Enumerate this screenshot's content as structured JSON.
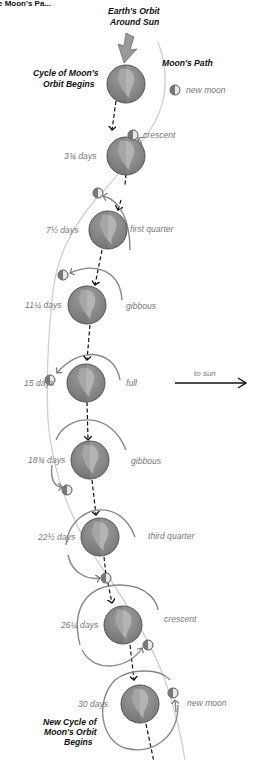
{
  "title_fragment": "e Moon's Pa...",
  "header": {
    "earth_orbit_line1": "Earth's Orbit",
    "earth_orbit_line2": "Around Sun",
    "cycle_begins_line1": "Cycle of Moon's",
    "cycle_begins_line2": "Orbit Begins",
    "moons_path": "Moon's Path"
  },
  "to_sun": "to sun",
  "footer": {
    "line1": "New Cycle of",
    "line2": "Moon's Orbit",
    "line3": "Begins"
  },
  "colors": {
    "earth_fill": "#8a8a8a",
    "earth_land": "#b5b5b5",
    "earth_stroke": "#555555",
    "orbit_arc": "#777777",
    "moon_path": "#c8c8c8",
    "arrow_black": "#111111",
    "big_arrow": "#9a9a9a"
  },
  "stages": [
    {
      "days": "",
      "phase": "new moon",
      "earth": [
        126,
        84
      ],
      "moon": [
        175,
        90
      ],
      "phase_label_pos": [
        186,
        93
      ]
    },
    {
      "days": "3¾ days",
      "phase": "crescent",
      "earth": [
        126,
        156
      ],
      "moon": [
        133,
        135
      ],
      "phase_label_pos": [
        143,
        138
      ]
    },
    {
      "days": "7½ days",
      "phase": "first quarter",
      "earth": [
        108,
        230
      ],
      "moon": [
        98,
        193
      ],
      "phase_label_pos": [
        130,
        232
      ]
    },
    {
      "days": "11¼ days",
      "phase": "gibbous",
      "earth": [
        87,
        305
      ],
      "moon": [
        63,
        275
      ],
      "phase_label_pos": [
        126,
        309
      ]
    },
    {
      "days": "15 days",
      "phase": "full",
      "earth": [
        86,
        383
      ],
      "moon": [
        50,
        380
      ],
      "phase_label_pos": [
        126,
        386
      ]
    },
    {
      "days": "18¾ days",
      "phase": "gibbous",
      "earth": [
        90,
        460
      ],
      "moon": [
        67,
        490
      ],
      "phase_label_pos": [
        131,
        464
      ]
    },
    {
      "days": "22½ days",
      "phase": "third quarter",
      "earth": [
        100,
        537
      ],
      "moon": [
        106,
        578
      ],
      "phase_label_pos": [
        148,
        539
      ]
    },
    {
      "days": "26¼ days",
      "phase": "crescent",
      "earth": [
        123,
        625
      ],
      "moon": [
        148,
        645
      ],
      "phase_label_pos": [
        164,
        622
      ]
    },
    {
      "days": "30 days",
      "phase": "new moon",
      "earth": [
        140,
        704
      ],
      "moon": [
        173,
        693
      ],
      "phase_label_pos": [
        187,
        706
      ]
    }
  ]
}
